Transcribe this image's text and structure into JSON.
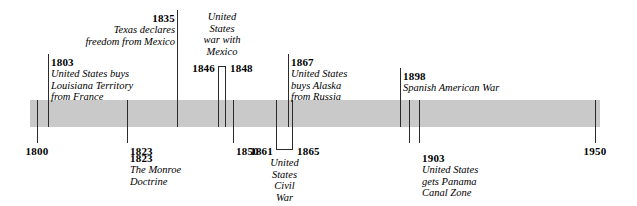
{
  "figure": {
    "type": "historical-timeline",
    "band_color": "#c9c9c9",
    "line_color": "#2b2b2b",
    "scale_start": 1800,
    "scale_end": 1950
  },
  "axis": {
    "years": [
      {
        "label": "1800",
        "value": 1800,
        "x": 37,
        "anchor": "center"
      },
      {
        "label": "1823",
        "value": 1823,
        "x": 127,
        "anchor": "left"
      },
      {
        "label": "1850",
        "value": 1850,
        "x": 233,
        "anchor": "left"
      },
      {
        "label": "1950",
        "value": 1950,
        "x": 595,
        "anchor": "center"
      }
    ]
  },
  "ticks": [
    {
      "name": "tick-1800",
      "year": 1800,
      "x": 37,
      "side": "below"
    },
    {
      "name": "tick-1803",
      "year": 1803,
      "x": 48,
      "side": "above"
    },
    {
      "name": "tick-1823",
      "year": 1823,
      "x": 127,
      "side": "below"
    },
    {
      "name": "tick-1835",
      "year": 1835,
      "x": 177,
      "side": "above"
    },
    {
      "name": "tick-1850",
      "year": 1850,
      "x": 233,
      "side": "below"
    },
    {
      "name": "tick-1867",
      "year": 1867,
      "x": 288,
      "side": "above"
    },
    {
      "name": "tick-1898",
      "year": 1898,
      "x": 400,
      "side": "above"
    },
    {
      "name": "tick-1900",
      "year": 1900,
      "x": 409,
      "side": "below"
    },
    {
      "name": "tick-1903",
      "year": 1903,
      "x": 419,
      "side": "below"
    },
    {
      "name": "tick-1950",
      "year": 1950,
      "x": 595,
      "side": "below"
    }
  ],
  "ranges": [
    {
      "name": "mexican-american-war",
      "start_label": "1846",
      "end_label": "1848",
      "start_year": 1846,
      "end_year": 1848,
      "x_start": 218,
      "x_end": 226,
      "direction": "above",
      "caption": [
        "United",
        "States",
        "war with",
        "Mexico"
      ]
    },
    {
      "name": "us-civil-war",
      "start_label": "1861",
      "end_label": "1865",
      "start_year": 1861,
      "end_year": 1865,
      "x_start": 276,
      "x_end": 293,
      "direction": "below",
      "caption": [
        "United",
        "States",
        "Civil",
        "War"
      ]
    }
  ],
  "events_above": [
    {
      "name": "louisiana-purchase",
      "year": "1803",
      "lines": [
        "United States buys",
        "Louisiana Territory",
        "from France"
      ],
      "align": "left",
      "x": 51,
      "y": 56
    },
    {
      "name": "texas-independence",
      "year": "1835",
      "lines": [
        "Texas declares",
        "freedom from Mexico"
      ],
      "align": "right",
      "x": 175,
      "y": 12
    },
    {
      "name": "alaska-purchase",
      "year": "1867",
      "lines": [
        "United States",
        "buys Alaska",
        "from Russia"
      ],
      "align": "left",
      "x": 291,
      "y": 56
    },
    {
      "name": "spanish-american-war",
      "year": "1898",
      "lines": [
        "Spanish American War"
      ],
      "align": "left",
      "x": 403,
      "y": 70
    }
  ],
  "events_below": [
    {
      "name": "monroe-doctrine",
      "year": "1823",
      "lines": [
        "The Monroe",
        "Doctrine"
      ],
      "align": "left",
      "x": 130,
      "y": 152
    },
    {
      "name": "panama-canal-zone",
      "year": "1903",
      "lines": [
        "United States",
        "gets Panama",
        "Canal Zone"
      ],
      "align": "left",
      "x": 422,
      "y": 152
    }
  ]
}
